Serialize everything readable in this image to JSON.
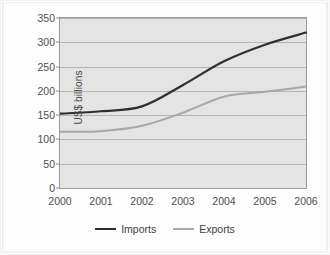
{
  "figure": {
    "background_color": "#fdfdfd",
    "plot_background_color": "#e4e4e4",
    "gridline_color": "#b4b4b4",
    "axis_color": "#9a9a9a"
  },
  "chart_data": {
    "type": "line",
    "title": "",
    "xlabel": "",
    "ylabel": "US$ billions",
    "categories": [
      "2000",
      "2001",
      "2002",
      "2003",
      "2004",
      "2005",
      "2006"
    ],
    "x": [
      2000,
      2001,
      2002,
      2003,
      2004,
      2005,
      2006
    ],
    "series": [
      {
        "name": "Imports",
        "color": "#2f2f2f",
        "line_width": 2.2,
        "values": [
          153,
          158,
          168,
          212,
          261,
          295,
          320
        ]
      },
      {
        "name": "Exports",
        "color": "#a8a8a8",
        "line_width": 2.0,
        "values": [
          116,
          117,
          128,
          155,
          188,
          198,
          209
        ]
      }
    ],
    "ylim": [
      0,
      350
    ],
    "yticks": [
      0,
      50,
      100,
      150,
      200,
      250,
      300,
      350
    ],
    "ytick_labels": [
      "0",
      "50",
      "100",
      "150",
      "200",
      "250",
      "300",
      "350"
    ],
    "xlim": [
      2000,
      2006
    ],
    "grid": "horizontal",
    "legend_position": "bottom-center",
    "legend": [
      {
        "label": "Imports",
        "color": "#2f2f2f"
      },
      {
        "label": "Exports",
        "color": "#a8a8a8"
      }
    ]
  }
}
